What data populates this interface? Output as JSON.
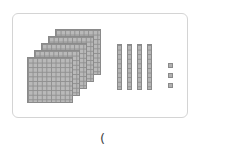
{
  "figure": {
    "hundreds_flats": 5,
    "tens_rods": 4,
    "ones_units": 3
  },
  "answer_prompt": {
    "text": "("
  },
  "colors": {
    "block_fill": "#b9b9b9",
    "block_grid": "#8f8f8f",
    "frame_border": "#d4d4d4"
  }
}
